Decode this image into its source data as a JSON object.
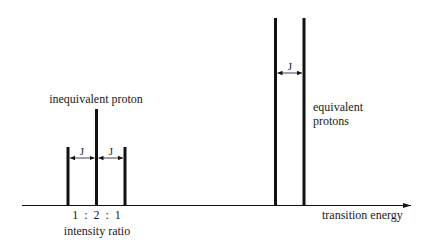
{
  "labels": {
    "inequivalent": "inequivalent proton",
    "equivalent_line1": "equivalent",
    "equivalent_line2": "protons",
    "axis": "transition energy",
    "ratio": "1  :  2  :  1",
    "ratio_caption": "intensity ratio",
    "coupling_left_1": "J",
    "coupling_left_2": "J",
    "coupling_right": "J"
  },
  "colors": {
    "line": "#111111",
    "text": "#1a1a1a",
    "background": "#ffffff"
  }
}
